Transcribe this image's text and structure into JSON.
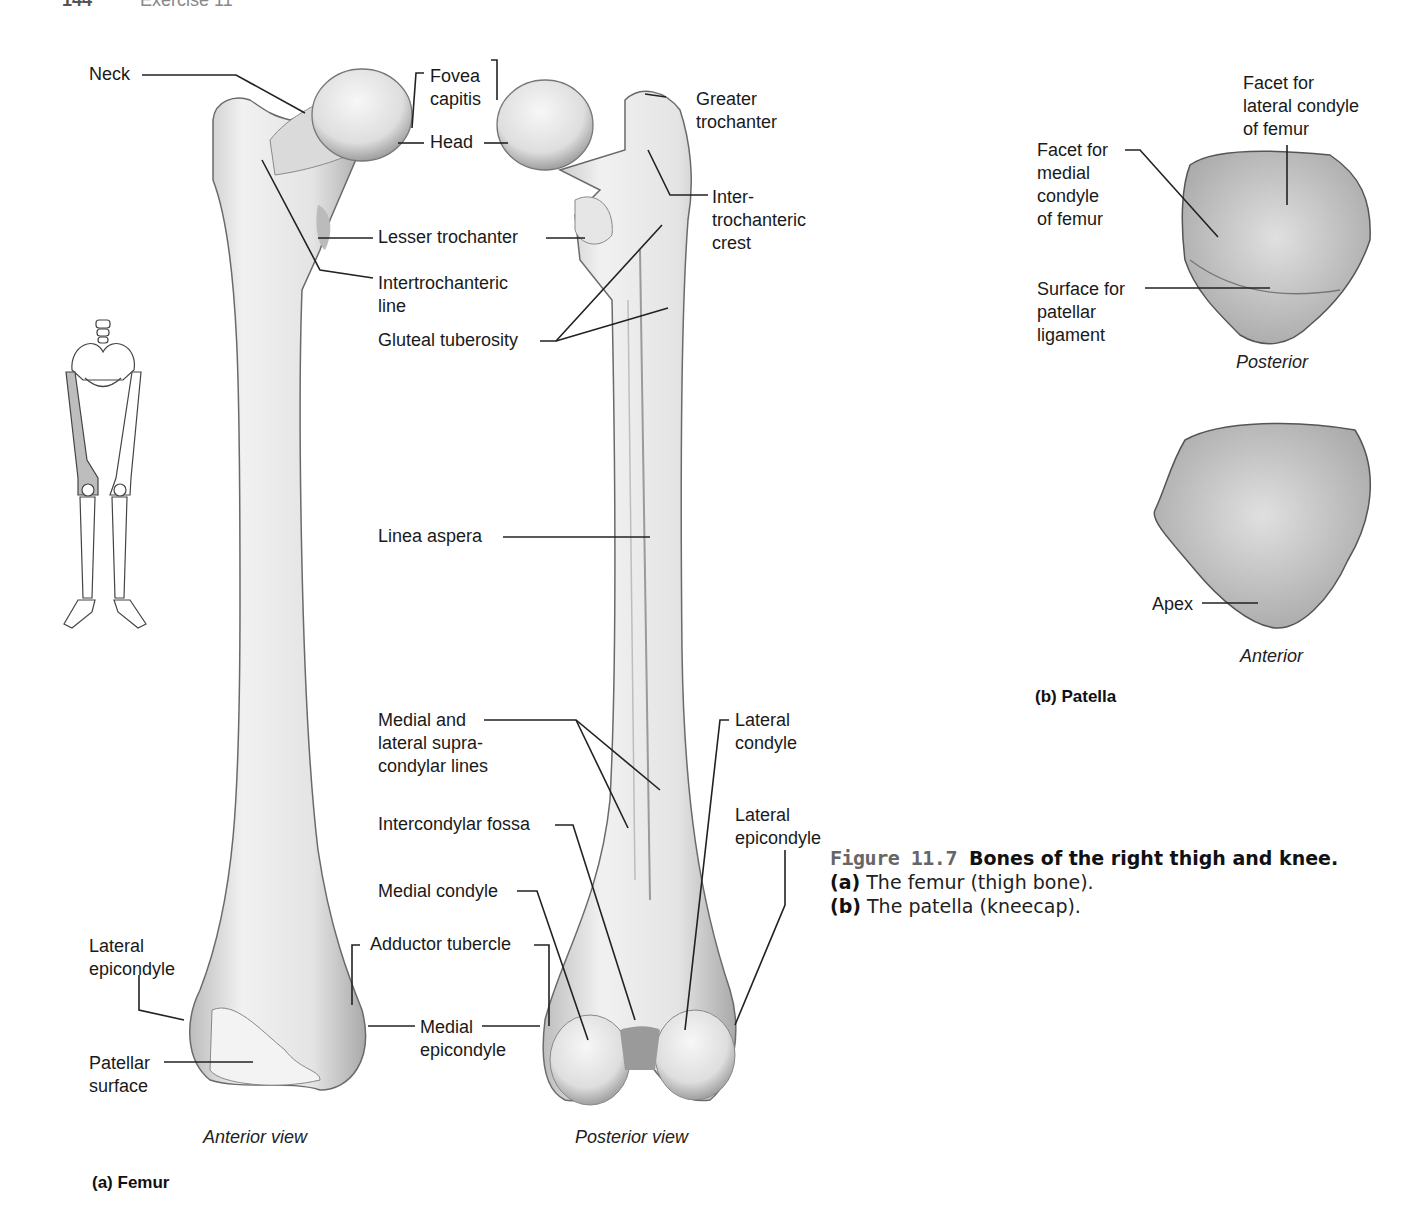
{
  "header": {
    "page_number": "144",
    "section": "Exercise 11"
  },
  "femur": {
    "panel_label": "(a) Femur",
    "anterior_view_label": "Anterior view",
    "posterior_view_label": "Posterior view",
    "labels": {
      "neck": "Neck",
      "fovea_capitis": "Fovea\ncapitis",
      "head": "Head",
      "greater_trochanter": "Greater\ntrochanter",
      "intertrochanteric_crest": "Inter-\ntrochanteric\ncrest",
      "lesser_trochanter": "Lesser trochanter",
      "intertrochanteric_line": "Intertrochanteric\nline",
      "gluteal_tuberosity": "Gluteal tuberosity",
      "linea_aspera": "Linea aspera",
      "supracondylar_lines": "Medial and\nlateral supra-\ncondylar lines",
      "lateral_condyle": "Lateral\ncondyle",
      "intercondylar_fossa": "Intercondylar fossa",
      "lateral_epicondyle_posterior": "Lateral\nepicondyle",
      "medial_condyle": "Medial condyle",
      "adductor_tubercle": "Adductor tubercle",
      "lateral_epicondyle_anterior": "Lateral\nepicondyle",
      "medial_epicondyle": "Medial\nepicondyle",
      "patellar_surface": "Patellar\nsurface"
    }
  },
  "patella": {
    "panel_label": "(b) Patella",
    "posterior_label": "Posterior",
    "anterior_label": "Anterior",
    "labels": {
      "facet_lateral": "Facet for\nlateral condyle\nof femur",
      "facet_medial": "Facet for\nmedial\ncondyle\nof femur",
      "surface_patellar_ligament": "Surface for\npatellar\nligament",
      "apex": "Apex"
    }
  },
  "caption": {
    "figure_number": "Figure 11.7",
    "title": "Bones of the right thigh and knee.",
    "part_a_marker": "(a)",
    "part_a_text": "The femur (thigh bone).",
    "part_b_marker": "(b)",
    "part_b_text": "The patella (kneecap)."
  },
  "colors": {
    "bone_fill": "#e9e9e9",
    "bone_shade": "#b5b5b5",
    "outline": "#555555",
    "leader": "#222222",
    "highlight_femur": "#bdbdbd"
  }
}
